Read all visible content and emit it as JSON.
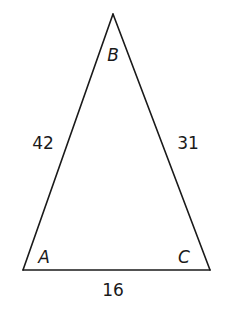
{
  "diagram": {
    "type": "triangle",
    "vertices": [
      {
        "id": "A",
        "label": "A",
        "x": 23,
        "y": 270
      },
      {
        "id": "B",
        "label": "B",
        "x": 113,
        "y": 14
      },
      {
        "id": "C",
        "label": "C",
        "x": 210,
        "y": 270
      }
    ],
    "sides": [
      {
        "id": "AB",
        "from": "A",
        "to": "B",
        "label": "42"
      },
      {
        "id": "BC",
        "from": "B",
        "to": "C",
        "label": "31"
      },
      {
        "id": "AC",
        "from": "A",
        "to": "C",
        "label": "16"
      }
    ],
    "colors": {
      "stroke": "#1a1a1a",
      "background": "#ffffff"
    }
  }
}
